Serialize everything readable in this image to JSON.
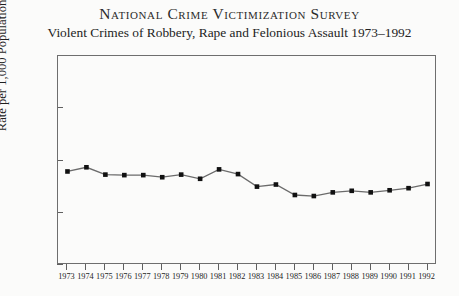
{
  "chart_data": {
    "type": "line",
    "title": "National Crime Victimization Survey",
    "subtitle": "Violent Crimes of Robbery, Rape and Felonious Assault 1973–1992",
    "xlabel": "",
    "ylabel": "Rate per 1,000 Population",
    "ylim": [
      0,
      40
    ],
    "yticks": [
      0,
      10,
      20,
      30,
      40
    ],
    "ytick_labels": [
      "0",
      "10",
      "20",
      "30",
      "40"
    ],
    "grid": false,
    "legend": null,
    "marker": "square",
    "line_color": "#6b6b6b",
    "marker_color": "#111111",
    "frame_color": "#6e6e6e",
    "categories": [
      "1973",
      "1974",
      "1975",
      "1976",
      "1977",
      "1978",
      "1979",
      "1980",
      "1981",
      "1982",
      "1983",
      "1984",
      "1985",
      "1986",
      "1987",
      "1988",
      "1989",
      "1990",
      "1991",
      "1992"
    ],
    "values": [
      17.9,
      18.7,
      17.3,
      17.2,
      17.2,
      16.8,
      17.3,
      16.5,
      18.3,
      17.4,
      15.0,
      15.4,
      13.4,
      13.2,
      13.9,
      14.2,
      13.9,
      14.3,
      14.7,
      15.5
    ],
    "series": [
      {
        "name": "Violent crime rate",
        "values": [
          17.9,
          18.7,
          17.3,
          17.2,
          17.2,
          16.8,
          17.3,
          16.5,
          18.3,
          17.4,
          15.0,
          15.4,
          13.4,
          13.2,
          13.9,
          14.2,
          13.9,
          14.3,
          14.7,
          15.5
        ]
      }
    ]
  }
}
